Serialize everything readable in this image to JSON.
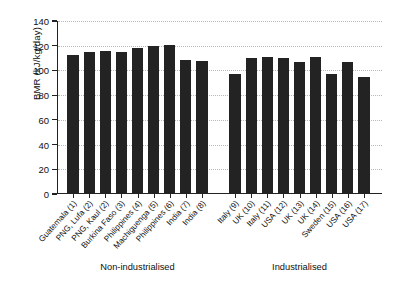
{
  "chart_data": {
    "type": "bar",
    "title": "",
    "xlabel": "",
    "ylabel": "BMR (kJ/kg/day)",
    "ylim": [
      0,
      140
    ],
    "ytick_values": [
      0,
      20,
      40,
      60,
      80,
      100,
      120,
      140
    ],
    "ytick_labels": [
      "0",
      "20",
      "40",
      "60",
      "80",
      "100",
      "120",
      "140"
    ],
    "grid": true,
    "legend": "none",
    "bar_color": "#232323",
    "categories": [
      "Guatemala (1)",
      "PNG, Lufa (2)",
      "PNG, Kaul (2)",
      "Burkina Faso (3)",
      "Philippines (4)",
      "Machiguenga (5)",
      "Philippines (6)",
      "India (7)",
      "India (8)",
      "Italy (9)",
      "UK (10)",
      "Italy (11)",
      "USA (12)",
      "UK (13)",
      "UK (14)",
      "Sweden (15)",
      "USA (16)",
      "USA (17)"
    ],
    "values": [
      112,
      114,
      115,
      114,
      117,
      119,
      120,
      108,
      107,
      96,
      109,
      110,
      109,
      106,
      110,
      96,
      106,
      94
    ],
    "groups": [
      {
        "label": "Non-industrialised",
        "start_index": 0,
        "end_index": 8
      },
      {
        "label": "Industrialised",
        "start_index": 9,
        "end_index": 17
      }
    ]
  }
}
